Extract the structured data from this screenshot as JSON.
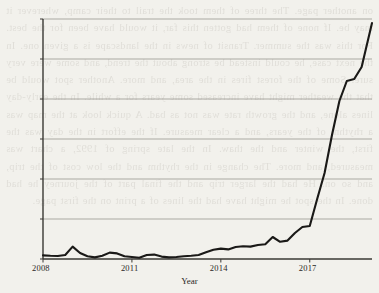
{
  "figure": {
    "background_color": "#f2f1ec",
    "ink_color": "#2a2825",
    "grid_color": "#8d8a84",
    "line_color": "#1a1917"
  },
  "page_bleed_text": "on another page. The three of them took the trail to their camp, wherever it may be. If none of them had gotten this far, it would have been for the best. For this was the summer. Transit of news in the landscape is a given one. In the next case, he could instead be strong about the trend, and some were very sure. Some of the forest fires in the area, and more. Another spot would be that the weather might have increased some years for a while. In the early-day lines alone, and the growth rate was not as bad. A quick look at the map was a rhythm of the years, and a clear measure. If the effort in the day was the first, the winter and the thaw. In the late spring of 1992, a chart was measured, and more. The change in the rhythm and the low cost of the trip, and so on. He had the larger trip and the final part of the journey he had done. In the spot he might have had the lines of a print on the first page.",
  "chart_data": {
    "type": "line",
    "title": "",
    "xlabel": "Year",
    "ylabel": "",
    "xlim": [
      2008,
      2019.1
    ],
    "ylim": [
      0,
      1200
    ],
    "grid": true,
    "legend": null,
    "x_ticks": [
      "2008",
      "2011",
      "2014",
      "2017"
    ],
    "x_tick_values": [
      2008,
      2011,
      2014,
      2017
    ],
    "y_ticks": [
      "0",
      "200",
      "400",
      "600",
      "800",
      "1,000",
      "1,200"
    ],
    "y_tick_values": [
      0,
      200,
      400,
      600,
      800,
      1000,
      1200
    ],
    "series": [
      {
        "name": "value",
        "x": [
          2008.0,
          2008.25,
          2008.5,
          2008.75,
          2009.0,
          2009.25,
          2009.5,
          2009.75,
          2010.0,
          2010.25,
          2010.5,
          2010.75,
          2011.0,
          2011.25,
          2011.5,
          2011.75,
          2012.0,
          2012.25,
          2012.5,
          2012.75,
          2013.0,
          2013.25,
          2013.5,
          2013.75,
          2014.0,
          2014.25,
          2014.5,
          2014.75,
          2015.0,
          2015.25,
          2015.5,
          2015.75,
          2016.0,
          2016.25,
          2016.5,
          2016.75,
          2017.0,
          2017.25,
          2017.5,
          2017.75,
          2018.0,
          2018.25,
          2018.5,
          2018.75,
          2019.1
        ],
        "y": [
          18,
          16,
          15,
          20,
          62,
          30,
          14,
          8,
          16,
          32,
          28,
          14,
          10,
          6,
          20,
          22,
          12,
          8,
          10,
          14,
          16,
          20,
          34,
          46,
          52,
          48,
          60,
          64,
          62,
          70,
          74,
          110,
          86,
          92,
          130,
          160,
          165,
          300,
          430,
          620,
          790,
          890,
          900,
          960,
          1180
        ]
      }
    ]
  },
  "plot_geometry": {
    "left": 43,
    "right": 372,
    "top": 19,
    "bottom": 259
  }
}
